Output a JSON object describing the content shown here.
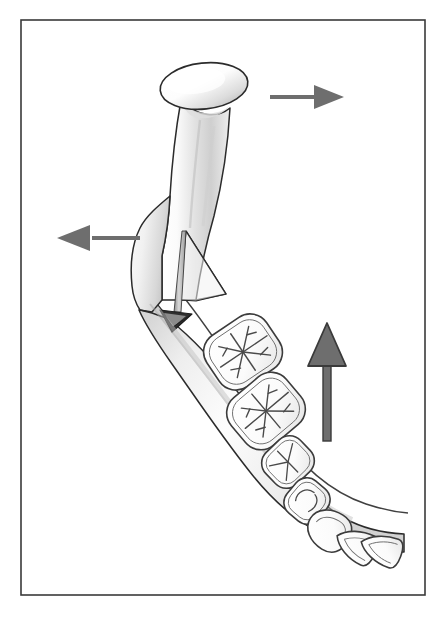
{
  "figure": {
    "title": "Sagittal split ramus osteotomy of the mandible with directional force arrows",
    "type": "anatomical-line-illustration",
    "canvas": {
      "width": 447,
      "height": 622,
      "background": "#ffffff"
    },
    "frame": {
      "name": "figure-border",
      "x": 21,
      "y": 20,
      "width": 404,
      "height": 575,
      "stroke": "#3a3a3a",
      "stroke_width": 1.6,
      "fill": "none"
    },
    "palette": {
      "outline": "#2b2b2b",
      "bone_light": "#ffffff",
      "bone_mid": "#e8e8e8",
      "bone_shadow": "#b9b9b9",
      "tooth_fill": "#fcfcfc",
      "tooth_outline": "#3c3c3c",
      "fissure": "#4a4a4a",
      "arrow_gray": "#6e6e6e",
      "arrow_dark_outline": "#3a3a3a",
      "wedge_dark": "#2e2e2e"
    },
    "structures": [
      {
        "name": "mandibular-condyle",
        "label": "Condyle (condylar head)",
        "shape": "ellipse",
        "cx": 204,
        "cy": 86,
        "rx": 44,
        "ry": 23,
        "rotation": -6
      },
      {
        "name": "mandibular-ramus",
        "label": "Ramus of mandible",
        "shape": "vertical-column",
        "top_y": 100,
        "bottom_y": 300
      },
      {
        "name": "mandibular-angle",
        "label": "Angle / posterior border proximal segment",
        "shape": "polygon",
        "apex_x": 150,
        "apex_y": 300
      },
      {
        "name": "mandibular-body",
        "label": "Body of mandible (distal segment)",
        "shape": "curved-band",
        "start_x": 185,
        "start_y": 300,
        "end_x": 400,
        "end_y": 520
      },
      {
        "name": "sagittal-split-line",
        "label": "Sagittal split osteotomy cut",
        "shape": "thin-sliver",
        "top_x": 186,
        "top_y": 231,
        "bottom_x": 176,
        "bottom_y": 315
      },
      {
        "name": "bone-wedge",
        "label": "Dark triangular bone wedge at inferior border",
        "shape": "triangle",
        "cx": 178,
        "cy": 320,
        "size": 22
      },
      {
        "name": "proximal-segment-outline",
        "label": "Proximal (condyle-bearing) segment overlay outline",
        "shape": "polyline"
      }
    ],
    "teeth": [
      {
        "name": "tooth-molar-1",
        "type": "molar",
        "cx": 243,
        "cy": 352,
        "rx": 36,
        "ry": 31,
        "rot": -34,
        "cusps": 5,
        "fissure_style": "plus-branching"
      },
      {
        "name": "tooth-molar-2",
        "type": "molar",
        "cx": 266,
        "cy": 411,
        "rx": 36,
        "ry": 31,
        "rot": -40,
        "cusps": 5,
        "fissure_style": "plus-branching"
      },
      {
        "name": "tooth-premolar-1",
        "type": "premolar",
        "cx": 288,
        "cy": 462,
        "rx": 24,
        "ry": 22,
        "rot": -44,
        "cusps": 3,
        "fissure_style": "y-branching"
      },
      {
        "name": "tooth-premolar-2",
        "type": "premolar",
        "cx": 307,
        "cy": 501,
        "rx": 21,
        "ry": 20,
        "rot": -50,
        "cusps": 2,
        "fissure_style": "short-arc"
      },
      {
        "name": "tooth-canine",
        "type": "canine",
        "cx": 329,
        "cy": 530,
        "rx": 21,
        "ry": 22,
        "rot": -58,
        "cusps": 1,
        "fissure_style": "none"
      },
      {
        "name": "tooth-incisor-1",
        "type": "incisor",
        "cx": 356,
        "cy": 545,
        "rx": 16,
        "ry": 21,
        "rot": -64,
        "cusps": 1,
        "fissure_style": "none"
      },
      {
        "name": "tooth-incisor-2",
        "type": "incisor",
        "cx": 381,
        "cy": 549,
        "rx": 15,
        "ry": 21,
        "rot": -70,
        "cusps": 1,
        "fissure_style": "none"
      }
    ],
    "arrows": [
      {
        "name": "arrow-right",
        "label": "Posterior/right directional arrow",
        "direction": "right",
        "style": "thin-shaft-solid-head",
        "color": "#6e6e6e",
        "shaft": {
          "x1": 270,
          "y1": 97,
          "x2": 318,
          "y2": 97,
          "thickness": 4
        },
        "head": {
          "tip_x": 344,
          "tip_y": 97,
          "back_x": 314,
          "half_height": 12
        }
      },
      {
        "name": "arrow-left",
        "label": "Anterior/left directional arrow",
        "direction": "left",
        "style": "thin-shaft-solid-head",
        "color": "#6e6e6e",
        "shaft": {
          "x1": 140,
          "y1": 238,
          "x2": 92,
          "y2": 238,
          "thickness": 4
        },
        "head": {
          "tip_x": 57,
          "tip_y": 238,
          "back_x": 90,
          "half_height": 13
        }
      },
      {
        "name": "arrow-up",
        "label": "Superior/upward directional arrow",
        "direction": "up",
        "style": "thick-shaft-outlined-head",
        "color": "#6e6e6e",
        "outline": "#3a3a3a",
        "shaft": {
          "x1": 327,
          "y1": 441,
          "x2": 327,
          "y2": 364,
          "thickness": 8
        },
        "head": {
          "tip_x": 327,
          "tip_y": 323,
          "back_y": 366,
          "half_width": 19
        }
      }
    ]
  }
}
